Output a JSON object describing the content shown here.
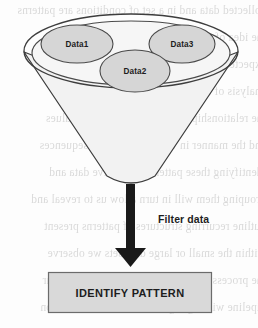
{
  "diagram": {
    "funnel": {
      "name": "funnel",
      "rim_label": "",
      "fill_color": "#f2f2f2",
      "stroke_color": "#3d3d3d"
    },
    "data_ellipses": [
      {
        "id": "data1",
        "label": "Data1",
        "fill_color": "#d6d6d6",
        "stroke_color": "#4a4a4a"
      },
      {
        "id": "data2",
        "label": "Data2",
        "fill_color": "#d6d6d6",
        "stroke_color": "#4a4a4a"
      },
      {
        "id": "data3",
        "label": "Data3",
        "fill_color": "#d6d6d6",
        "stroke_color": "#4a4a4a"
      }
    ],
    "arrow": {
      "label": "Filter data",
      "color": "#1a1a1a",
      "direction": "down"
    },
    "output_box": {
      "label": "IDENTIFY PATTERN",
      "fill_color": "#d9d9d9",
      "stroke_color": "#6b6b6b",
      "text_color": "#1d1d1d"
    }
  },
  "background_bleed": {
    "note": "faint mirrored show-through text from reverse page of scan",
    "lines": [
      "collected data and in a set of conditions are patterns",
      "the idea of the data set that contains of this  a",
      "expected to model the but and to find we from",
      "analysis of the large volumes of data that are",
      "the relationships that exist between the values",
      "and the manner in which they define sequences",
      "identifying these patterns of relative data and",
      "grouping them will in turn allow us to reveal and",
      "outline recurring structures of patterns present",
      "within the small or large data sets we observe",
      "the process within which the filter stage of our",
      "pipeline will highlight the relevant information"
    ]
  }
}
